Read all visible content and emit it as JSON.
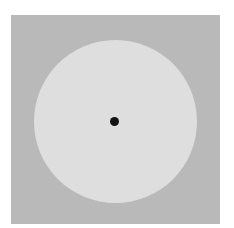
{
  "figure": {
    "background_color": "#b9b9b9",
    "disc_color": "#dedede",
    "dot_color": "#141414"
  }
}
